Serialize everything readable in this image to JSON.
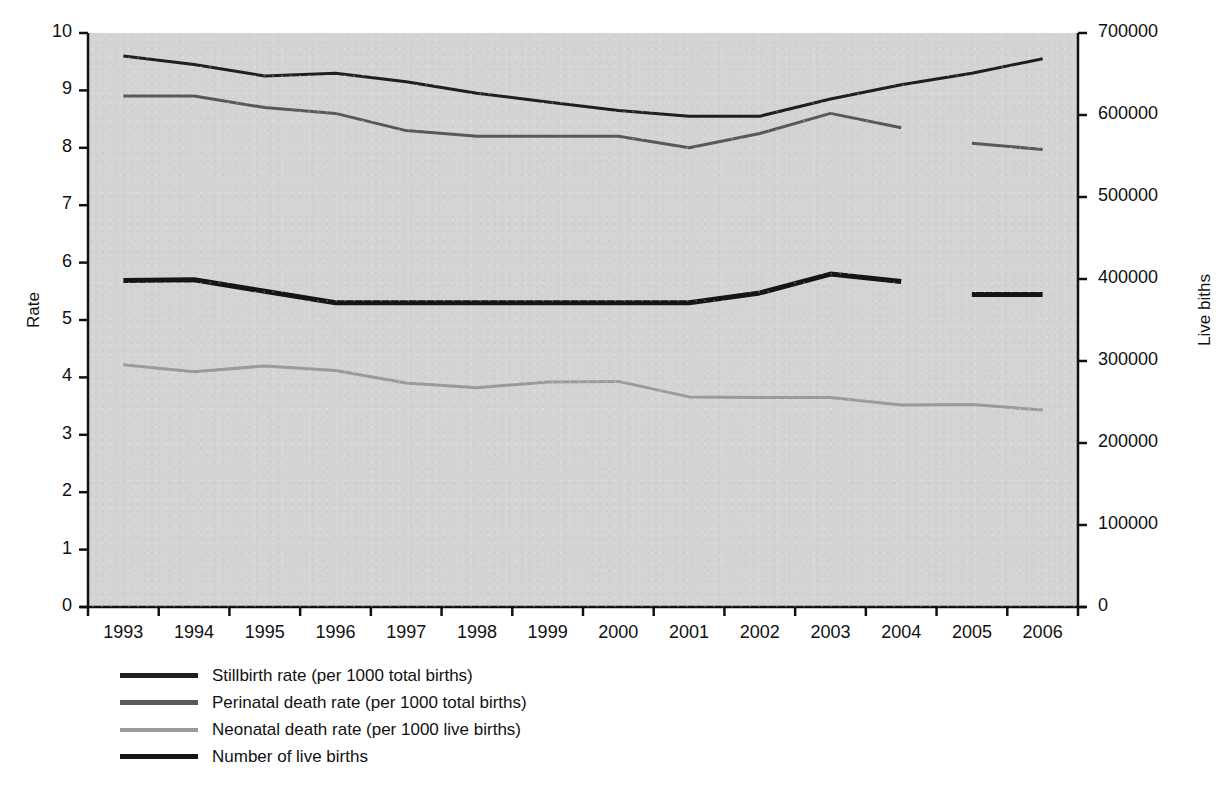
{
  "chart_data": {
    "type": "line",
    "title": "",
    "xlabel": "",
    "ylabel": "Rate",
    "y2label": "Live biths",
    "categories": [
      "1993",
      "1994",
      "1995",
      "1996",
      "1997",
      "1998",
      "1999",
      "2000",
      "2001",
      "2002",
      "2003",
      "2004",
      "2005",
      "2006"
    ],
    "ylim": [
      0,
      10
    ],
    "yticks": [
      "0",
      "1",
      "2",
      "3",
      "4",
      "5",
      "6",
      "7",
      "8",
      "9",
      "10"
    ],
    "y2lim": [
      0,
      700000
    ],
    "y2ticks": [
      "0",
      "100000",
      "200000",
      "300000",
      "400000",
      "500000",
      "600000",
      "700000"
    ],
    "grid": false,
    "legend_position": "below-left",
    "series": [
      {
        "name": "Stillbirth rate (per 1000 total births)",
        "color": "#1f1f1f",
        "axis": "left",
        "width": 3,
        "values": [
          9.6,
          9.45,
          9.25,
          9.3,
          9.15,
          8.95,
          8.8,
          8.65,
          8.55,
          8.55,
          8.85,
          9.1,
          9.3,
          9.55
        ]
      },
      {
        "name": "Perinatal death rate (per 1000 total births)",
        "color": "#59595b",
        "axis": "left",
        "width": 3,
        "values": [
          8.9,
          8.9,
          8.7,
          8.6,
          8.3,
          8.2,
          8.2,
          8.2,
          8.0,
          8.25,
          8.6,
          8.35,
          8.08,
          7.97
        ],
        "gaps": [
          [
            11,
            12
          ]
        ]
      },
      {
        "name": "Neonatal death rate (per 1000 live births)",
        "color": "#9b9b9d",
        "axis": "left",
        "width": 3,
        "values": [
          4.22,
          4.1,
          4.2,
          4.12,
          3.9,
          3.82,
          3.92,
          3.93,
          3.66,
          3.65,
          3.65,
          3.52,
          3.53,
          3.43
        ]
      },
      {
        "name": "Number of live births",
        "color": "#151515",
        "axis": "right",
        "width": 5,
        "values": [
          398000,
          399000,
          385000,
          371000,
          371000,
          371000,
          371000,
          371000,
          371000,
          383000,
          406000,
          397000,
          381000,
          381000
        ],
        "gaps": [
          [
            11,
            12
          ]
        ]
      }
    ]
  },
  "legend": {
    "items": [
      {
        "label": "Stillbirth rate (per 1000 total births)",
        "color": "#1f1f1f",
        "thickness": 5
      },
      {
        "label": "Perinatal death rate (per 1000 total births)",
        "color": "#59595b",
        "thickness": 5
      },
      {
        "label": "Neonatal death rate (per 1000 live births)",
        "color": "#9b9b9d",
        "thickness": 4
      },
      {
        "label": "Number of live births",
        "color": "#151515",
        "thickness": 5
      }
    ]
  },
  "plot": {
    "background": "#d4d4d4",
    "axis_color": "#111111"
  }
}
